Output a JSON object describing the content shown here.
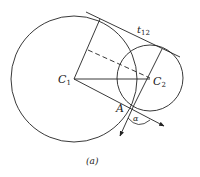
{
  "diagram": {
    "type": "geometry",
    "caption": "(a)",
    "labels": {
      "c1": "C",
      "c1_sub": "1",
      "c2": "C",
      "c2_sub": "2",
      "point_a": "A",
      "tangent": "t",
      "tangent_sub": "12",
      "angle": "α"
    },
    "circles": [
      {
        "name": "C1",
        "cx": 74,
        "cy": 79,
        "r": 63
      },
      {
        "name": "C2",
        "cx": 150,
        "cy": 78,
        "r": 33
      }
    ],
    "colors": {
      "stroke": "#222222",
      "background": "#ffffff"
    }
  }
}
